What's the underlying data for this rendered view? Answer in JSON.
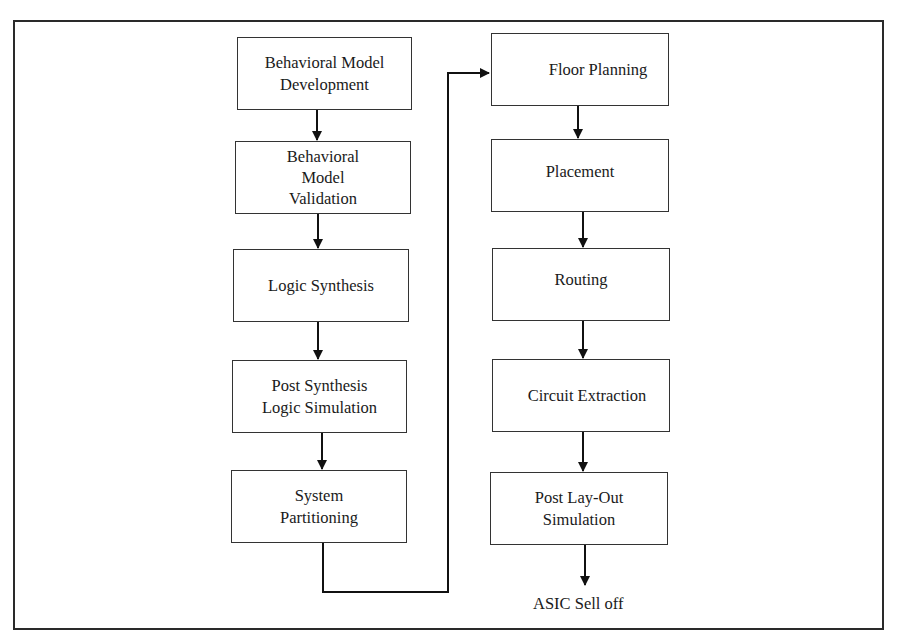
{
  "diagram": {
    "left_column": [
      {
        "id": "behavioral-model-development",
        "lines": [
          "Behavioral Model",
          "Development"
        ]
      },
      {
        "id": "behavioral-model-validation",
        "lines": [
          "Behavioral",
          "Model",
          "Validation"
        ]
      },
      {
        "id": "logic-synthesis",
        "lines": [
          "Logic Synthesis"
        ]
      },
      {
        "id": "post-synthesis-logic-simulation",
        "lines": [
          "Post Synthesis",
          "Logic Simulation"
        ]
      },
      {
        "id": "system-partitioning",
        "lines": [
          "System",
          "Partitioning"
        ]
      }
    ],
    "right_column": [
      {
        "id": "floor-planning",
        "lines": [
          "Floor Planning"
        ]
      },
      {
        "id": "placement",
        "lines": [
          "Placement"
        ]
      },
      {
        "id": "routing",
        "lines": [
          "Routing"
        ]
      },
      {
        "id": "circuit-extraction",
        "lines": [
          "Circuit Extraction"
        ]
      },
      {
        "id": "post-layout-simulation",
        "lines": [
          "Post Lay-Out",
          "Simulation"
        ]
      }
    ],
    "end_label": "ASIC Sell off",
    "colors": {
      "line": "#1a1a1a",
      "border": "#333333",
      "background": "#ffffff"
    }
  }
}
